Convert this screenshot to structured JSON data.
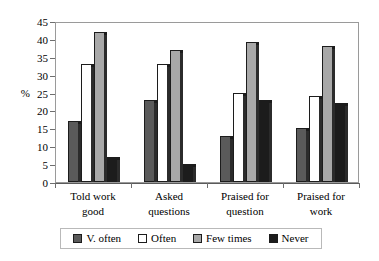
{
  "chart_data": {
    "type": "bar",
    "title": "",
    "xlabel": "",
    "ylabel": "%",
    "ylim": [
      0,
      45
    ],
    "ytick_step": 5,
    "yticks": [
      0,
      5,
      10,
      15,
      20,
      25,
      30,
      35,
      40,
      45
    ],
    "grid": false,
    "legend_position": "bottom",
    "categories": [
      "Told work good",
      "Asked questions",
      "Praised for question",
      "Praised for work"
    ],
    "category_lines": [
      [
        "Told work",
        "good"
      ],
      [
        "Asked",
        "questions"
      ],
      [
        "Praised for",
        "question"
      ],
      [
        "Praised for",
        "work"
      ]
    ],
    "series": [
      {
        "name": "V. often",
        "color": "#5a5a5a",
        "values": [
          17,
          23,
          13,
          15
        ]
      },
      {
        "name": "Often",
        "color": "#ffffff",
        "values": [
          33,
          33,
          25,
          24
        ]
      },
      {
        "name": "Few times",
        "color": "#a8a8a8",
        "values": [
          42,
          37,
          39,
          38
        ]
      },
      {
        "name": "Never",
        "color": "#1c1c1c",
        "values": [
          7,
          5,
          23,
          22
        ]
      }
    ]
  },
  "axes": {
    "y_title": "%"
  },
  "legend": {
    "items": [
      {
        "label": "V. often",
        "color": "#5a5a5a"
      },
      {
        "label": "Often",
        "color": "#ffffff"
      },
      {
        "label": "Few times",
        "color": "#a8a8a8"
      },
      {
        "label": "Never",
        "color": "#1c1c1c"
      }
    ]
  }
}
